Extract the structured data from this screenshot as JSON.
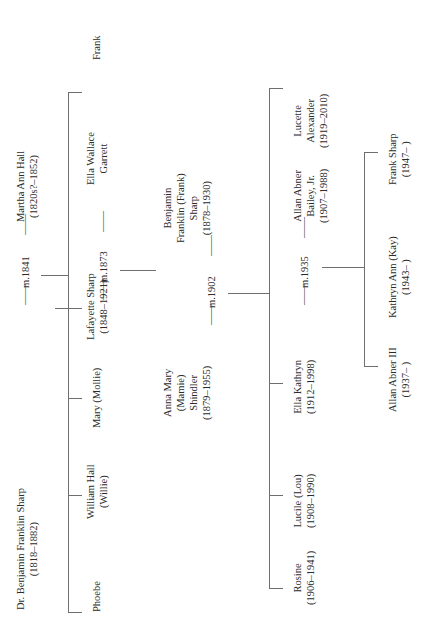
{
  "document": {
    "type": "genealogy-chart",
    "title": "Sharp family descendant chart",
    "orientation": "rotated-90-counterclockwise",
    "line_color": "#6f6f6f",
    "text_color": "#2b2b2b"
  },
  "generation1": {
    "label": "generation-1",
    "spouse_a": {
      "name_line1": "Dr. Benjamin Franklin Sharp",
      "dates": "(1818–1882)"
    },
    "marriage": "m.1841",
    "spouse_b": {
      "name_line1": "Martha Ann Hall",
      "dates": "(1820s?–1852)"
    },
    "dash_left": "——",
    "dash_right": "——"
  },
  "generation2": {
    "label": "generation-2",
    "children": [
      {
        "name_line1": "Phoebe",
        "name_line2": "",
        "dates": ""
      },
      {
        "name_line1": "William Hall",
        "name_line2": "(Willie)",
        "dates": ""
      },
      {
        "name_line1": "Mary (Mollie)",
        "name_line2": "",
        "dates": ""
      },
      {
        "name_line1": "Lafayette Sharp",
        "name_line2": "",
        "dates": "(1848–1921)"
      },
      {
        "name_line1": "Frank",
        "name_line2": "",
        "dates": ""
      }
    ],
    "marriage": "m.1873",
    "spouse": {
      "name_line1": "Ella Wallace",
      "name_line2": "Garrett",
      "dates": ""
    },
    "dash_left": "——",
    "dash_right": "——"
  },
  "generation3": {
    "label": "generation-3",
    "spouse_a": {
      "name_line1": "Anna Mary",
      "name_line2": "(Mamie)",
      "name_line3": "Shindler",
      "dates": "(1879–1955)"
    },
    "marriage": "m.1902",
    "spouse_b": {
      "name_line1": "Benjamin",
      "name_line2": "Franklin (Frank)",
      "name_line3": "Sharp",
      "dates": "(1878–1930)"
    },
    "dash_left": "——",
    "dash_right": "——"
  },
  "generation4": {
    "label": "generation-4",
    "children": [
      {
        "name_line1": "Rosine",
        "name_line2": "",
        "dates": "(1906–1941)"
      },
      {
        "name_line1": "Lucile (Lou)",
        "name_line2": "",
        "dates": "(1908–1990)"
      },
      {
        "name_line1": "Ella Kathryn",
        "name_line2": "",
        "dates": "(1912–1998)"
      }
    ],
    "marriage": "m.1935",
    "spouse": {
      "name_line1": "Allan Abner",
      "name_line2": "Bailey, Jr.",
      "dates": "(1907–1988)"
    },
    "extra": {
      "name_line1": "Lucette",
      "name_line2": "Alexander",
      "dates": "(1919–2010)"
    },
    "dash_left": "——",
    "dash_right": "——"
  },
  "generation5": {
    "label": "generation-5",
    "children": [
      {
        "name_line1": "Allan Abner III",
        "dates": "(1937–  )"
      },
      {
        "name_line1": "Kathryn Ann (Kay)",
        "dates": "(1943–  )"
      },
      {
        "name_line1": "Frank Sharp",
        "dates": "(1947–  )"
      }
    ]
  }
}
